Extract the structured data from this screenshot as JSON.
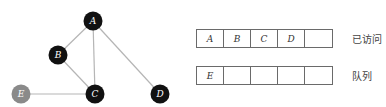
{
  "graph": {
    "nodes": [
      {
        "id": "A",
        "x": 93,
        "y": 21,
        "color": "#111111"
      },
      {
        "id": "B",
        "x": 58,
        "y": 55,
        "color": "#111111"
      },
      {
        "id": "C",
        "x": 95,
        "y": 94,
        "color": "#111111"
      },
      {
        "id": "D",
        "x": 160,
        "y": 94,
        "color": "#111111"
      },
      {
        "id": "E",
        "x": 21,
        "y": 94,
        "color": "#8a8a8a"
      }
    ],
    "edges": [
      [
        "A",
        "B"
      ],
      [
        "A",
        "C"
      ],
      [
        "A",
        "D"
      ],
      [
        "B",
        "C"
      ],
      [
        "C",
        "E"
      ]
    ],
    "edge_color": "#b5b5b5"
  },
  "visited": {
    "label": "已访问",
    "cells": [
      "A",
      "B",
      "C",
      "D",
      ""
    ]
  },
  "queue": {
    "label": "队列",
    "cells": [
      "E",
      "",
      "",
      "",
      ""
    ]
  }
}
